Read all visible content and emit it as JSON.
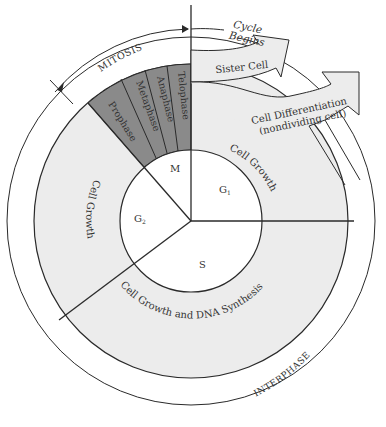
{
  "diagram": {
    "colors": {
      "background": "#ffffff",
      "interphase_ring": "#ececec",
      "mitosis_ring": "#8a8a8a",
      "inner_circle": "#ffffff",
      "arrow_fill": "#ececec",
      "line": "#2a2a2a",
      "text": "#333333"
    },
    "outer_labels": {
      "mitosis": "MITOSIS",
      "interphase": "INTERPHASE"
    },
    "mitosis_phases": [
      "Prophase",
      "Metaphase",
      "Anaphase",
      "Telophase"
    ],
    "inner_phases": {
      "m": "M",
      "g1": "G",
      "g1_sub": "1",
      "g2": "G",
      "g2_sub": "2",
      "s": "S"
    },
    "ring_labels": {
      "g1_growth": "Cell Growth",
      "g2_growth": "Cell Growth",
      "s_growth": "Cell Growth and DNA Synthesis"
    },
    "arrows": {
      "cycle_begins_line1": "Cycle",
      "cycle_begins_line2": "Begins",
      "sister_cell": "Sister Cell",
      "differentiation_line1": "Cell Differentiation",
      "differentiation_line2": "(nondividing cell)"
    }
  }
}
